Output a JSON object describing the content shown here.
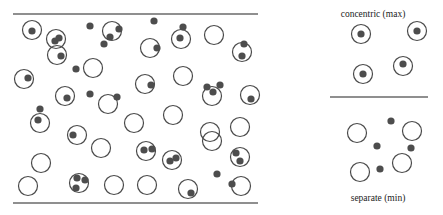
{
  "figure": {
    "colors": {
      "circle_stroke": "#4a4a4a",
      "dot_fill": "#4d4d4d",
      "line": "#6a6a6a"
    },
    "main_panel": {
      "top_line": {
        "x1": 13,
        "x2": 258,
        "y": 14
      },
      "bottom_line": {
        "x1": 13,
        "x2": 258,
        "y": 203
      },
      "circles": [
        [
          32,
          30
        ],
        [
          56,
          39
        ],
        [
          57,
          55
        ],
        [
          93,
          68
        ],
        [
          112,
          31
        ],
        [
          150,
          48
        ],
        [
          181,
          39
        ],
        [
          214,
          35
        ],
        [
          242,
          52
        ],
        [
          24,
          79
        ],
        [
          65,
          96
        ],
        [
          40,
          123
        ],
        [
          77,
          135
        ],
        [
          145,
          84
        ],
        [
          108,
          104
        ],
        [
          134,
          123
        ],
        [
          173,
          115
        ],
        [
          183,
          76
        ],
        [
          212,
          96
        ],
        [
          250,
          95
        ],
        [
          240,
          127
        ],
        [
          210,
          132
        ],
        [
          41,
          163
        ],
        [
          28,
          186
        ],
        [
          79,
          183
        ],
        [
          101,
          148
        ],
        [
          114,
          185
        ],
        [
          147,
          185
        ],
        [
          146,
          151
        ],
        [
          172,
          160
        ],
        [
          212,
          141
        ],
        [
          240,
          157
        ],
        [
          241,
          186
        ],
        [
          188,
          189
        ]
      ],
      "dots": [
        [
          32,
          31
        ],
        [
          55,
          41
        ],
        [
          59,
          38
        ],
        [
          61,
          56
        ],
        [
          90,
          26
        ],
        [
          76,
          69
        ],
        [
          119,
          29
        ],
        [
          110,
          37
        ],
        [
          104,
          44
        ],
        [
          154,
          21
        ],
        [
          157,
          48
        ],
        [
          183,
          27
        ],
        [
          180,
          38
        ],
        [
          244,
          44
        ],
        [
          242,
          56
        ],
        [
          28,
          78
        ],
        [
          67,
          98
        ],
        [
          90,
          94
        ],
        [
          40,
          109
        ],
        [
          38,
          120
        ],
        [
          73,
          135
        ],
        [
          151,
          85
        ],
        [
          117,
          97
        ],
        [
          207,
          87
        ],
        [
          213,
          92
        ],
        [
          220,
          85
        ],
        [
          251,
          99
        ],
        [
          77,
          178
        ],
        [
          85,
          180
        ],
        [
          76,
          188
        ],
        [
          144,
          150
        ],
        [
          152,
          149
        ],
        [
          170,
          161
        ],
        [
          176,
          158
        ],
        [
          236,
          153
        ],
        [
          240,
          161
        ],
        [
          217,
          174
        ],
        [
          232,
          184
        ],
        [
          191,
          193
        ]
      ]
    },
    "side_panel": {
      "divider": {
        "x1": 330,
        "x2": 428,
        "y": 97
      },
      "top_label": {
        "text": "concentric (max)",
        "x": 373,
        "y": 9
      },
      "bottom_label": {
        "text": "separate (min)",
        "x": 378,
        "y": 193
      },
      "concentric": {
        "circles": [
          [
            361,
            34
          ],
          [
            417,
            31
          ],
          [
            363,
            74
          ],
          [
            403,
            66
          ]
        ],
        "dots": [
          [
            361,
            34
          ],
          [
            417,
            31
          ],
          [
            363,
            74
          ],
          [
            403,
            64
          ]
        ]
      },
      "separate": {
        "circles": [
          [
            357,
            133
          ],
          [
            412,
            131
          ],
          [
            402,
            163
          ],
          [
            360,
            172
          ]
        ],
        "dots": [
          [
            391,
            121
          ],
          [
            377,
            146
          ],
          [
            411,
            148
          ],
          [
            380,
            169
          ]
        ]
      }
    }
  }
}
